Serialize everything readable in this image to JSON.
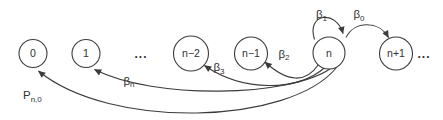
{
  "diagram": {
    "kind": "state-transition-diagram",
    "background_color": "#ffffff",
    "line_color": "#3c3c3c",
    "text_color": "#303030",
    "nodes": [
      {
        "label": "0"
      },
      {
        "label": "1"
      },
      {
        "label": "n−2"
      },
      {
        "label": "n−1"
      },
      {
        "label": "n"
      },
      {
        "label": "n+1"
      }
    ],
    "ellipsis_left": "...",
    "ellipsis_right": "...",
    "transitions": {
      "beta1": {
        "base": "β",
        "sub": "1"
      },
      "beta0": {
        "base": "β",
        "sub": "0"
      },
      "beta2": {
        "base": "β",
        "sub": "2"
      },
      "beta3": {
        "base": "β",
        "sub": "3"
      },
      "betan": {
        "base": "β",
        "sub": "n"
      },
      "pn0": {
        "base": "P",
        "sub": "n,0"
      }
    }
  }
}
